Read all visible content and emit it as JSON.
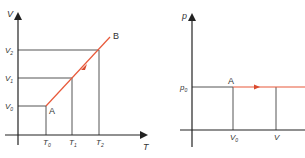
{
  "colors": {
    "axis": "#222222",
    "guide": "#555555",
    "process": "#e8593a",
    "text": "#333333"
  },
  "left_diagram": {
    "y_axis_label": "V",
    "x_axis_label": "T",
    "y_ticks": [
      {
        "label": "V",
        "sub": "2"
      },
      {
        "label": "V",
        "sub": "1"
      },
      {
        "label": "V",
        "sub": "0"
      }
    ],
    "x_ticks": [
      {
        "label": "T",
        "sub": "0"
      },
      {
        "label": "T",
        "sub": "1"
      },
      {
        "label": "T",
        "sub": "2"
      }
    ],
    "point_a": "A",
    "point_b": "B"
  },
  "right_diagram": {
    "y_axis_label": "p",
    "y_ticks": [
      {
        "label": "p",
        "sub": "0"
      }
    ],
    "x_ticks": [
      {
        "label": "V",
        "sub": "0"
      },
      {
        "label": "V",
        "sub": ""
      }
    ],
    "point_a": "A"
  }
}
